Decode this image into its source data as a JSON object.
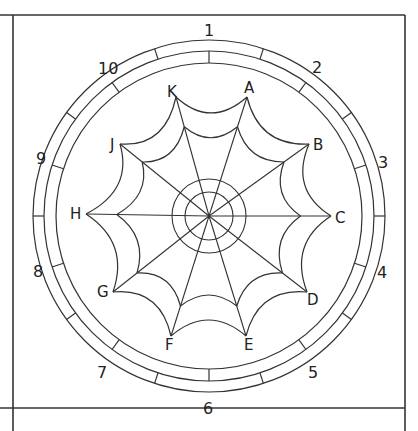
{
  "diagram": {
    "center": [
      209,
      216
    ],
    "frame": {
      "top": 15,
      "left": 13,
      "right": 405,
      "bottom": 408,
      "stroke": "#333333"
    },
    "rings": {
      "outer_radius": 176,
      "middle_radius": 165,
      "inner_radius": 153
    },
    "hub_circles": {
      "inner_radius": 24,
      "outer_radius": 37
    },
    "points": [
      {
        "label": "A",
        "x": 247,
        "y": 97
      },
      {
        "label": "B",
        "x": 309,
        "y": 144
      },
      {
        "label": "C",
        "x": 331,
        "y": 216
      },
      {
        "label": "D",
        "x": 307,
        "y": 292
      },
      {
        "label": "E",
        "x": 246,
        "y": 336
      },
      {
        "label": "F",
        "x": 171,
        "y": 336
      },
      {
        "label": "G",
        "x": 113,
        "y": 292
      },
      {
        "label": "H",
        "x": 86,
        "y": 214
      },
      {
        "label": "J",
        "x": 120,
        "y": 144
      },
      {
        "label": "K",
        "x": 176,
        "y": 97
      }
    ],
    "point_labels": [
      {
        "text": "A",
        "x": 244,
        "y": 93
      },
      {
        "text": "B",
        "x": 313,
        "y": 150
      },
      {
        "text": "C",
        "x": 335,
        "y": 223
      },
      {
        "text": "D",
        "x": 307,
        "y": 305
      },
      {
        "text": "E",
        "x": 244,
        "y": 350
      },
      {
        "text": "F",
        "x": 165,
        "y": 350
      },
      {
        "text": "G",
        "x": 97,
        "y": 297
      },
      {
        "text": "H",
        "x": 70,
        "y": 219
      },
      {
        "text": "J",
        "x": 110,
        "y": 150
      },
      {
        "text": "K",
        "x": 167,
        "y": 97
      }
    ],
    "segment_numbers": [
      {
        "text": "1",
        "x": 204,
        "y": 36
      },
      {
        "text": "2",
        "x": 312,
        "y": 73
      },
      {
        "text": "3",
        "x": 378,
        "y": 168
      },
      {
        "text": "4",
        "x": 377,
        "y": 278
      },
      {
        "text": "5",
        "x": 308,
        "y": 378
      },
      {
        "text": "6",
        "x": 203,
        "y": 414
      },
      {
        "text": "7",
        "x": 97,
        "y": 378
      },
      {
        "text": "8",
        "x": 33,
        "y": 277
      },
      {
        "text": "9",
        "x": 36,
        "y": 164
      },
      {
        "text": "10",
        "x": 98,
        "y": 74
      }
    ]
  }
}
